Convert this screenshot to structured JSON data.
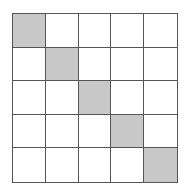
{
  "diagram": {
    "type": "grid",
    "rows": 5,
    "cols": 5,
    "shaded_cells": [
      [
        0,
        0
      ],
      [
        1,
        1
      ],
      [
        2,
        2
      ],
      [
        3,
        3
      ],
      [
        4,
        4
      ]
    ],
    "colors": {
      "shaded": "#c8c8c8",
      "empty": "#ffffff",
      "line": "#555555"
    }
  }
}
